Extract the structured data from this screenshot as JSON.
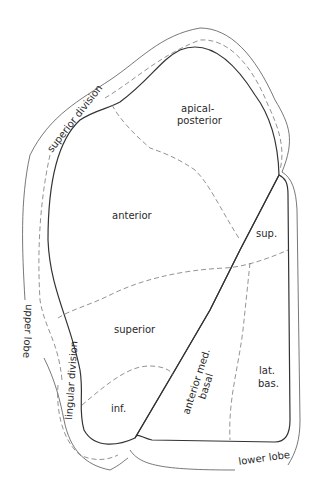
{
  "diagram": {
    "type": "anatomical-segment-map",
    "labels": {
      "apical_posterior_line1": "apical-",
      "apical_posterior_line2": "posterior",
      "anterior": "anterior",
      "sup": "sup.",
      "superior": "superior",
      "inf": "inf.",
      "anterior_med_basal_line1": "anterior med.",
      "anterior_med_basal_line2": "basal",
      "lat_bas_line1": "lat.",
      "lat_bas_line2": "bas.",
      "superior_division": "superior division",
      "lingular_division": "lingular division",
      "upper_lobe": "upper lobe",
      "lower_lobe": "lower lobe"
    },
    "colors": {
      "line": "#333333",
      "dashed": "#777777",
      "text": "#2a2a2a",
      "background": "#ffffff"
    }
  }
}
